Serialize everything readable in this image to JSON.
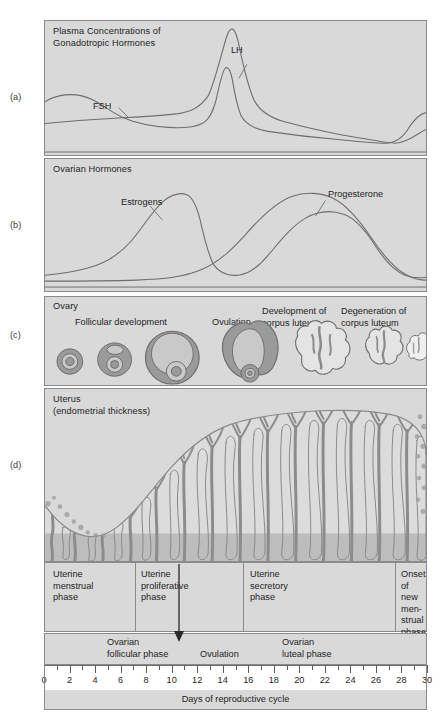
{
  "figure": {
    "axis_title": "Days of reproductive cycle",
    "colors": {
      "panel_fill": "#d9d9d9",
      "panel_border": "#8a8a8a",
      "curve": "#6e6e6e",
      "tissue_dark": "#8c8c8c",
      "tissue_light": "#c9c9c9",
      "text": "#1e1e1e"
    }
  },
  "side_labels": [
    {
      "key": "a",
      "label": "(a)"
    },
    {
      "key": "b",
      "label": "(b)"
    },
    {
      "key": "c",
      "label": "(c)"
    },
    {
      "key": "d",
      "label": "(d)"
    }
  ],
  "panels": {
    "a": {
      "title": "Plasma Concentrations of\nGonadotropic Hormones",
      "curve_labels": [
        {
          "name": "lh",
          "text": "LH"
        },
        {
          "name": "fsh",
          "text": "FSH"
        }
      ]
    },
    "b": {
      "title": "Ovarian Hormones",
      "curve_labels": [
        {
          "name": "estrogens",
          "text": "Estrogens"
        },
        {
          "name": "progesterone",
          "text": "Progesterone"
        }
      ]
    },
    "c": {
      "title": "Ovary",
      "stage_labels": [
        {
          "name": "follicular-development",
          "text": "Follicular development"
        },
        {
          "name": "ovulation",
          "text": "Ovulation"
        },
        {
          "name": "development-corpus-luteum",
          "text": "Development of\ncorpus luteum"
        },
        {
          "name": "degeneration-corpus-luteum",
          "text": "Degeneration of\ncorpus luteum"
        }
      ]
    },
    "d": {
      "title": "Uterus\n(endometrial thickness)"
    }
  },
  "uterine_phases": [
    {
      "name": "uterine-menstrual-phase",
      "text": "Uterine\nmenstrual\nphase"
    },
    {
      "name": "uterine-proliferative-phase",
      "text": "Uterine\nproliferative\nphase"
    },
    {
      "name": "uterine-secretory-phase",
      "text": "Uterine\nsecretory\nphase"
    },
    {
      "name": "onset-of-new-menstrual-phase",
      "text": "Onset\nof new\nmen-\nstrual\nphase"
    }
  ],
  "ovarian_phases": [
    {
      "name": "ovarian-follicular-phase",
      "text": "Ovarian\nfollicular phase"
    },
    {
      "name": "ovulation-marker",
      "text": "Ovulation"
    },
    {
      "name": "ovarian-luteal-phase",
      "text": "Ovarian\nluteal phase"
    }
  ],
  "chart_data": {
    "type": "line",
    "xlabel": "Days of reproductive cycle",
    "ylabel": "",
    "xlim": [
      0,
      30
    ],
    "grid": false,
    "legend": "inline-annotations",
    "tick_labels": [
      "0",
      "2",
      "4",
      "6",
      "8",
      "10",
      "12",
      "14",
      "16",
      "18",
      "20",
      "22",
      "24",
      "26",
      "28",
      "30"
    ],
    "tick_values": [
      0,
      2,
      4,
      6,
      8,
      10,
      12,
      14,
      16,
      18,
      20,
      22,
      24,
      26,
      28,
      30
    ],
    "minor_tick_step": 1,
    "panels": [
      {
        "panel": "a",
        "label": "Plasma Concentrations of Gonadotropic Hormones",
        "ylim": [
          0,
          100
        ],
        "series": [
          {
            "name": "LH",
            "x": [
              0,
              2,
              4,
              6,
              8,
              10,
              11,
              12,
              12.6,
              13,
              13.4,
              14,
              15,
              16,
              18,
              20,
              22,
              24,
              26,
              27,
              28,
              29,
              30
            ],
            "values": [
              16,
              16,
              17,
              18,
              19,
              22,
              26,
              40,
              80,
              96,
              80,
              40,
              26,
              23,
              20,
              17,
              14,
              12,
              11,
              14,
              24,
              30,
              32
            ]
          },
          {
            "name": "FSH",
            "x": [
              0,
              1,
              2,
              3,
              4,
              6,
              8,
              10,
              11,
              12,
              12.8,
              13.2,
              13.8,
              15,
              16,
              18,
              20,
              22,
              24,
              26,
              27,
              28,
              29,
              30
            ],
            "values": [
              34,
              36,
              37,
              36,
              33,
              28,
              26,
              25,
              27,
              34,
              62,
              70,
              52,
              31,
              28,
              26,
              24,
              22,
              20,
              19,
              22,
              30,
              33,
              34
            ]
          }
        ]
      },
      {
        "panel": "b",
        "label": "Ovarian Hormones",
        "ylim": [
          0,
          100
        ],
        "series": [
          {
            "name": "Estrogens",
            "x": [
              0,
              2,
              4,
              6,
              8,
              10,
              11,
              12,
              13,
              13.6,
              14,
              15,
              16,
              17,
              18,
              20,
              22,
              24,
              25,
              26,
              27,
              28,
              29,
              30
            ],
            "values": [
              8,
              9,
              11,
              14,
              20,
              38,
              56,
              72,
              78,
              72,
              52,
              28,
              18,
              17,
              22,
              44,
              56,
              56,
              52,
              40,
              26,
              16,
              13,
              14
            ]
          },
          {
            "name": "Progesterone",
            "x": [
              0,
              4,
              8,
              10,
              12,
              13,
              14,
              15,
              16,
              17,
              18,
              19,
              20,
              21,
              22,
              23,
              24,
              25,
              26,
              27,
              28,
              29,
              30
            ],
            "values": [
              4,
              4,
              4,
              5,
              6,
              8,
              14,
              26,
              44,
              62,
              76,
              84,
              88,
              88,
              84,
              76,
              62,
              44,
              26,
              14,
              7,
              5,
              5
            ]
          }
        ]
      },
      {
        "panel": "d",
        "label": "Uterus (endometrial thickness)",
        "ylim": [
          0,
          100
        ],
        "series": [
          {
            "name": "Endometrial thickness",
            "x": [
              0,
              1,
              2,
              3,
              4,
              5,
              6,
              8,
              10,
              12,
              14,
              16,
              18,
              20,
              22,
              24,
              26,
              27,
              28,
              29,
              30
            ],
            "values": [
              34,
              26,
              18,
              12,
              10,
              12,
              18,
              30,
              44,
              58,
              70,
              80,
              86,
              90,
              92,
              92,
              90,
              82,
              60,
              36,
              24
            ]
          }
        ]
      }
    ],
    "phase_markers": [
      {
        "name": "ovulation",
        "day": 14
      }
    ]
  }
}
